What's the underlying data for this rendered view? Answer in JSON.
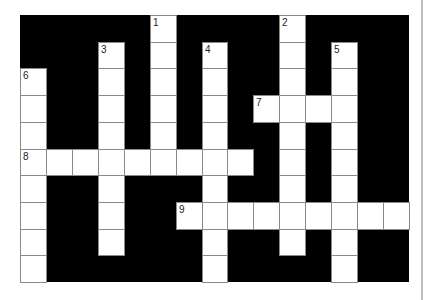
{
  "puzzle": {
    "type": "crossword",
    "rows": 10,
    "cols": 15,
    "colors": {
      "block": "#000000",
      "cell": "#ffffff",
      "border": "#8a8a8a"
    },
    "entries": [
      {
        "number": "1",
        "direction": "down",
        "row": 0,
        "col": 5,
        "length": 6
      },
      {
        "number": "2",
        "direction": "down",
        "row": 0,
        "col": 10,
        "length": 9
      },
      {
        "number": "3",
        "direction": "down",
        "row": 1,
        "col": 3,
        "length": 8
      },
      {
        "number": "4",
        "direction": "down",
        "row": 1,
        "col": 7,
        "length": 9
      },
      {
        "number": "5",
        "direction": "down",
        "row": 1,
        "col": 12,
        "length": 9
      },
      {
        "number": "6",
        "direction": "down",
        "row": 2,
        "col": 0,
        "length": 8
      },
      {
        "number": "7",
        "direction": "across",
        "row": 3,
        "col": 9,
        "length": 4
      },
      {
        "number": "8",
        "direction": "across",
        "row": 5,
        "col": 0,
        "length": 9
      },
      {
        "number": "9",
        "direction": "across",
        "row": 7,
        "col": 6,
        "length": 9
      }
    ]
  }
}
